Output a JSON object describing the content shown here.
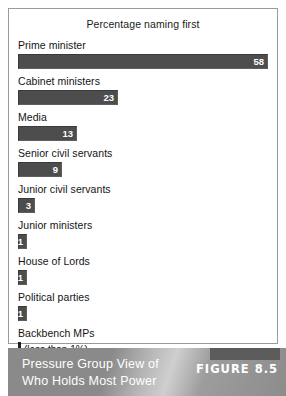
{
  "figure": {
    "caption_line1": "Pressure Group View of",
    "caption_line2": "Who Holds Most Power",
    "figure_number": "FIGURE 8.5"
  },
  "colors": {
    "bar_fill": "#4d4d4d",
    "bar_value_text": "#ffffff",
    "panel_border": "#9a9a9a",
    "footer_band": "#8e8e8e",
    "footer_text": "#ffffff"
  },
  "chart_data": {
    "type": "bar",
    "title": "Percentage naming first",
    "xlabel": "",
    "ylabel": "",
    "orientation": "horizontal",
    "grid": false,
    "legend": null,
    "xlim": [
      0,
      58
    ],
    "categories": [
      "Prime minister",
      "Cabinet ministers",
      "Media",
      "Senior civil servants",
      "Junior civil servants",
      "Junior ministers",
      "House of Lords",
      "Political parties",
      "Backbench MPs"
    ],
    "values": [
      58,
      23,
      13,
      9,
      3,
      1,
      1,
      1,
      0
    ],
    "value_labels": [
      "58",
      "23",
      "13",
      "9",
      "3",
      "1",
      "1",
      "1",
      ""
    ],
    "annotations": [
      {
        "category": "Backbench MPs",
        "text": "(less than 1%)"
      }
    ],
    "units": "percent"
  },
  "rows": [
    {
      "label": "Prime minister",
      "value_label": "58",
      "bar_px": 250,
      "note": ""
    },
    {
      "label": "Cabinet ministers",
      "value_label": "23",
      "bar_px": 100,
      "note": ""
    },
    {
      "label": "Media",
      "value_label": "13",
      "bar_px": 59,
      "note": ""
    },
    {
      "label": "Senior civil servants",
      "value_label": "9",
      "bar_px": 44,
      "note": ""
    },
    {
      "label": "Junior civil servants",
      "value_label": "3",
      "bar_px": 17,
      "note": ""
    },
    {
      "label": "Junior ministers",
      "value_label": "1",
      "bar_px": 9,
      "note": ""
    },
    {
      "label": "House of Lords",
      "value_label": "1",
      "bar_px": 9,
      "note": ""
    },
    {
      "label": "Political parties",
      "value_label": "1",
      "bar_px": 9,
      "note": ""
    },
    {
      "label": "Backbench MPs",
      "value_label": "",
      "bar_px": 3,
      "note": "(less than 1%)"
    }
  ]
}
